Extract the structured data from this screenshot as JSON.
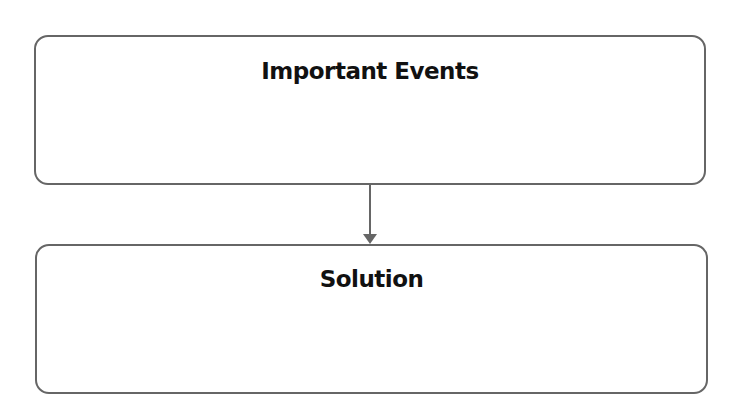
{
  "diagram": {
    "type": "flowchart",
    "nodes": [
      {
        "id": "important_events",
        "label": "Important Events"
      },
      {
        "id": "solution",
        "label": "Solution"
      }
    ],
    "edges": [
      {
        "from": "important_events",
        "to": "solution",
        "style": "arrow"
      }
    ],
    "colors": {
      "border": "#666666",
      "arrow": "#666666",
      "text": "#111111",
      "background": "#ffffff"
    }
  }
}
